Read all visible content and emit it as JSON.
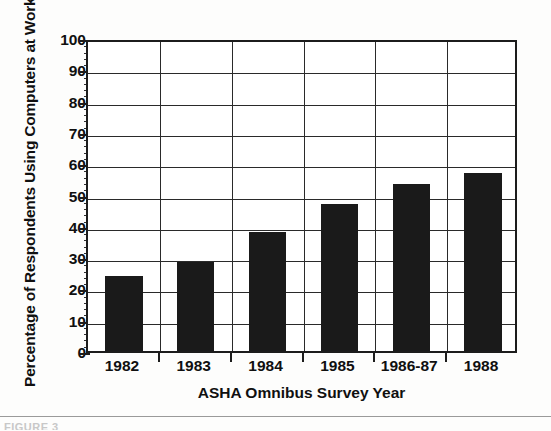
{
  "chart_data": {
    "type": "bar",
    "title": "",
    "xlabel": "ASHA Omnibus Survey Year",
    "ylabel": "Percentage of Respondents Using Computers at Work",
    "categories": [
      "1982",
      "1983",
      "1984",
      "1985",
      "1986-87",
      "1988"
    ],
    "values": [
      24,
      28.5,
      38,
      47,
      53.5,
      57
    ],
    "ylim": [
      0,
      100
    ],
    "ytick_labels": [
      "0",
      "10",
      "20",
      "30",
      "40",
      "50",
      "60",
      "70",
      "80",
      "90",
      "100"
    ],
    "ytick_values": [
      0,
      10,
      20,
      30,
      40,
      50,
      60,
      70,
      80,
      90,
      100
    ],
    "yminor_interval": 2,
    "grid": "both",
    "legend": "none",
    "bar_color": "#1a1a1a",
    "axis_color": "#1c1c1c",
    "grid_color": "#2a2a2a",
    "background": "#ffffff"
  },
  "footer": {
    "caption": "FIGURE 3"
  }
}
